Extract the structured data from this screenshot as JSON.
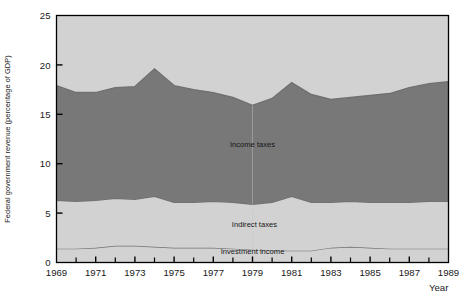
{
  "chart_data": {
    "type": "area",
    "stacked": true,
    "title": "",
    "xlabel": "Year",
    "ylabel": "Federal government revenue (percentage of GDP)",
    "xlim": [
      1969,
      1989
    ],
    "ylim": [
      0,
      25
    ],
    "ytick_labels": [
      "0",
      "5",
      "10",
      "15",
      "20",
      "25"
    ],
    "ytick_values": [
      0,
      5,
      10,
      15,
      20,
      25
    ],
    "xtick_labels": [
      "1969",
      "1971",
      "1973",
      "1975",
      "1977",
      "1979",
      "1981",
      "1983",
      "1985",
      "1987",
      "1989"
    ],
    "xtick_values": [
      1969,
      1971,
      1973,
      1975,
      1977,
      1979,
      1981,
      1983,
      1985,
      1987,
      1989
    ],
    "x_minor_ticks": [
      1970,
      1972,
      1974,
      1976,
      1978,
      1980,
      1982,
      1984,
      1986,
      1988
    ],
    "grid": false,
    "legend_position": "inline-labels",
    "x": [
      1969,
      1970,
      1971,
      1972,
      1973,
      1974,
      1975,
      1976,
      1977,
      1978,
      1979,
      1980,
      1981,
      1982,
      1983,
      1984,
      1985,
      1986,
      1987,
      1988,
      1989
    ],
    "series": [
      {
        "name": "Investment income",
        "color": "#d2d2d2",
        "values": [
          1.4,
          1.4,
          1.5,
          1.7,
          1.7,
          1.6,
          1.5,
          1.5,
          1.5,
          1.4,
          1.3,
          1.2,
          1.2,
          1.2,
          1.5,
          1.6,
          1.5,
          1.4,
          1.4,
          1.4,
          1.4
        ]
      },
      {
        "name": "Indirect taxes",
        "color": "#d2d2d2",
        "values": [
          4.9,
          4.8,
          4.8,
          4.8,
          4.7,
          5.1,
          4.6,
          4.6,
          4.7,
          4.7,
          4.6,
          4.9,
          5.5,
          4.9,
          4.6,
          4.6,
          4.6,
          4.7,
          4.7,
          4.8,
          4.8
        ]
      },
      {
        "name": "Income taxes",
        "color": "#787878",
        "values": [
          11.6,
          11.0,
          10.9,
          11.2,
          11.4,
          12.9,
          11.8,
          11.4,
          11.0,
          10.6,
          10.0,
          10.5,
          11.5,
          10.9,
          10.4,
          10.5,
          10.8,
          11.0,
          11.6,
          11.9,
          12.1
        ]
      }
    ],
    "totals": [
      17.9,
      17.2,
      17.2,
      17.7,
      17.8,
      19.6,
      17.9,
      17.5,
      17.2,
      16.7,
      15.9,
      16.6,
      18.2,
      17.0,
      16.5,
      16.7,
      16.9,
      17.1,
      17.7,
      18.1,
      18.3
    ],
    "band_label_positions": [
      {
        "label": "Income taxes",
        "x": 1979,
        "y": 11.7
      },
      {
        "label": "Indirect taxes",
        "x": 1979.1,
        "y": 3.6
      },
      {
        "label": "Investment income",
        "x": 1979.0,
        "y": 0.85
      }
    ],
    "background_color": "#ffffff",
    "plot_border_color": "#000000",
    "top_band_color": "#d2d2d2",
    "mid_band_color": "#787878",
    "band_edge_color": "#707070"
  }
}
